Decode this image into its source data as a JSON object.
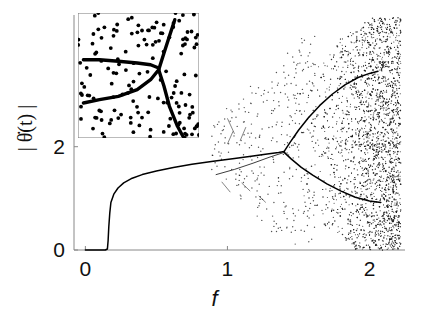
{
  "chart_data": {
    "type": "scatter",
    "title": "",
    "xlabel": "f",
    "ylabel": "| θ̇(t) |",
    "xlim": [
      -0.08,
      2.25
    ],
    "ylim": [
      0,
      4.55
    ],
    "xticks": [
      0,
      1,
      2
    ],
    "xticklabels": [
      "0",
      "1",
      "2"
    ],
    "yticks": [
      0,
      2
    ],
    "yticklabels": [
      "0",
      "2"
    ],
    "grid": false,
    "legend": null,
    "series": [
      {
        "name": "main-branch",
        "type": "line",
        "comment": "flat at zero then sharp rise at f=0.16, saturating toward 1.9",
        "points": [
          [
            0.0,
            0.0
          ],
          [
            0.05,
            0.0
          ],
          [
            0.1,
            0.0
          ],
          [
            0.14,
            0.0
          ],
          [
            0.155,
            0.02
          ],
          [
            0.16,
            0.18
          ],
          [
            0.165,
            0.45
          ],
          [
            0.172,
            0.72
          ],
          [
            0.18,
            0.92
          ],
          [
            0.2,
            1.08
          ],
          [
            0.23,
            1.2
          ],
          [
            0.27,
            1.3
          ],
          [
            0.33,
            1.39
          ],
          [
            0.4,
            1.46
          ],
          [
            0.5,
            1.53
          ],
          [
            0.62,
            1.6
          ],
          [
            0.75,
            1.66
          ],
          [
            0.9,
            1.72
          ],
          [
            1.05,
            1.77
          ],
          [
            1.18,
            1.82
          ],
          [
            1.28,
            1.86
          ],
          [
            1.36,
            1.89
          ],
          [
            1.4,
            1.91
          ]
        ]
      },
      {
        "name": "upper-branch",
        "type": "line",
        "comment": "upper arm of pitchfork at f=1.40 rising to secondary split",
        "points": [
          [
            1.4,
            1.91
          ],
          [
            1.44,
            2.08
          ],
          [
            1.5,
            2.32
          ],
          [
            1.57,
            2.56
          ],
          [
            1.65,
            2.8
          ],
          [
            1.74,
            3.02
          ],
          [
            1.83,
            3.2
          ],
          [
            1.92,
            3.34
          ],
          [
            2.0,
            3.42
          ],
          [
            2.06,
            3.46
          ]
        ]
      },
      {
        "name": "lower-branch",
        "type": "line",
        "comment": "lower arm of pitchfork descending toward 0.9",
        "points": [
          [
            1.4,
            1.89
          ],
          [
            1.45,
            1.76
          ],
          [
            1.52,
            1.6
          ],
          [
            1.6,
            1.45
          ],
          [
            1.7,
            1.28
          ],
          [
            1.8,
            1.14
          ],
          [
            1.9,
            1.02
          ],
          [
            2.0,
            0.95
          ],
          [
            2.08,
            0.92
          ]
        ]
      },
      {
        "name": "pre-bifurcation-lower-tail",
        "type": "line",
        "comment": "faint lower tail entering the bifurcation point from the left",
        "points": [
          [
            0.92,
            1.46
          ],
          [
            1.05,
            1.56
          ],
          [
            1.18,
            1.68
          ],
          [
            1.3,
            1.8
          ],
          [
            1.4,
            1.89
          ]
        ]
      },
      {
        "name": "chaotic-scatter",
        "type": "scatter",
        "comment": "dense cloud of iterates in the chaotic regime f>1.45, densest near f=2",
        "n_points": 2600,
        "x_range": [
          1.42,
          2.22
        ],
        "y_range": [
          0.0,
          4.5
        ]
      },
      {
        "name": "sparse-transient-scatter",
        "type": "scatter",
        "comment": "sparse scattered iterates between f=0.9 and f=1.6",
        "n_points": 320,
        "x_range": [
          0.88,
          1.62
        ],
        "y_range": [
          0.1,
          4.4
        ]
      }
    ],
    "bifurcations": [
      {
        "name": "onset-of-motion",
        "f": 0.16,
        "value": 0.0
      },
      {
        "name": "primary-pitchfork",
        "f": 1.4,
        "value": 1.9
      },
      {
        "name": "secondary-split-upper",
        "f": 1.92,
        "value": 3.34
      },
      {
        "name": "secondary-split-lower",
        "f": 1.92,
        "value": 1.02
      }
    ],
    "inset": {
      "name": "magnified-bifurcation-inset",
      "comment": "zoom on the primary pitchfork showing two branches merging then splitting, overlaid with noise points",
      "xlim": [
        1.1,
        1.55
      ],
      "ylim": [
        1.55,
        2.3
      ],
      "frame": true,
      "series": [
        {
          "name": "inset-upper-branch",
          "type": "line",
          "points": [
            [
              1.12,
              2.02
            ],
            [
              1.18,
              2.02
            ],
            [
              1.25,
              2.01
            ],
            [
              1.32,
              2.0
            ],
            [
              1.37,
              1.99
            ],
            [
              1.4,
              1.97
            ]
          ]
        },
        {
          "name": "inset-lower-branch",
          "type": "line",
          "points": [
            [
              1.12,
              1.76
            ],
            [
              1.18,
              1.78
            ],
            [
              1.25,
              1.8
            ],
            [
              1.32,
              1.84
            ],
            [
              1.37,
              1.9
            ],
            [
              1.4,
              1.96
            ]
          ]
        },
        {
          "name": "inset-ascending-branch",
          "type": "line",
          "points": [
            [
              1.4,
              1.96
            ],
            [
              1.42,
              2.06
            ],
            [
              1.44,
              2.16
            ],
            [
              1.46,
              2.26
            ]
          ]
        },
        {
          "name": "inset-descending-branch",
          "type": "line",
          "points": [
            [
              1.4,
              1.96
            ],
            [
              1.42,
              1.86
            ],
            [
              1.44,
              1.74
            ],
            [
              1.47,
              1.62
            ],
            [
              1.49,
              1.56
            ]
          ]
        },
        {
          "name": "inset-noise-points",
          "type": "scatter",
          "n_points": 150,
          "x_range": [
            1.1,
            1.55
          ],
          "y_range": [
            1.55,
            2.3
          ]
        }
      ]
    }
  }
}
